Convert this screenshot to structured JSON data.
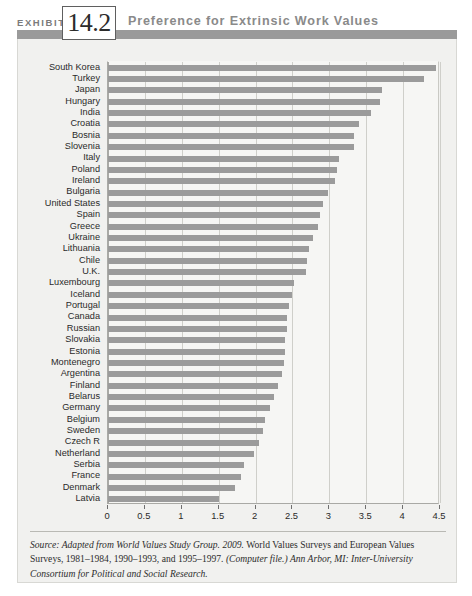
{
  "header": {
    "exhibit_word": "EXHIBIT",
    "exhibit_number": "14.2",
    "title": "Preference for Extrinsic Work Values"
  },
  "colors": {
    "bar": "#9b9b9b",
    "header_bar": "#9a9a9a",
    "panel_bg": "#f1f1ef",
    "plot_bg": "#f6f6f4",
    "gridline": "#cfcfca",
    "axis": "#a9a9a5",
    "title_text": "#8a8a8a"
  },
  "source": {
    "part1_italic": "Source: Adapted from World Values Study Group. 2009.",
    "part2": " World Values Surveys and European Values Surveys, 1981–1984, 1990–1993, and 1995–1997. ",
    "part3_italic": "(Computer file.) Ann Arbor, MI: Inter-University Consortium for Political and Social Research."
  },
  "chart_data": {
    "type": "bar",
    "orientation": "horizontal",
    "title": "Preference for Extrinsic Work Values",
    "xlabel": "",
    "ylabel": "",
    "xlim": [
      0,
      4.5
    ],
    "grid": true,
    "legend": null,
    "xticks": [
      "0",
      "0.5",
      "1",
      "1.5",
      "2",
      "2.5",
      "3",
      "3.5",
      "4",
      "4.5"
    ],
    "xtick_values": [
      0,
      0.5,
      1,
      1.5,
      2,
      2.5,
      3,
      3.5,
      4,
      4.5
    ],
    "categories": [
      "South Korea",
      "Turkey",
      "Japan",
      "Hungary",
      "India",
      "Croatia",
      "Bosnia",
      "Slovenia",
      "Italy",
      "Poland",
      "Ireland",
      "Bulgaria",
      "United States",
      "Spain",
      "Greece",
      "Ukraine",
      "Lithuania",
      "Chile",
      "U.K.",
      "Luxembourg",
      "Iceland",
      "Portugal",
      "Canada",
      "Russian",
      "Slovakia",
      "Estonia",
      "Montenegro",
      "Argentina",
      "Finland",
      "Belarus",
      "Germany",
      "Belgium",
      "Sweden",
      "Czech R",
      "Netherland",
      "Serbia",
      "France",
      "Denmark",
      "Latvia"
    ],
    "values": [
      4.45,
      4.28,
      3.72,
      3.68,
      3.57,
      3.4,
      3.33,
      3.33,
      3.13,
      3.1,
      3.08,
      2.98,
      2.92,
      2.88,
      2.85,
      2.78,
      2.72,
      2.7,
      2.68,
      2.52,
      2.5,
      2.45,
      2.43,
      2.42,
      2.4,
      2.4,
      2.38,
      2.36,
      2.3,
      2.25,
      2.2,
      2.13,
      2.1,
      2.05,
      1.98,
      1.85,
      1.8,
      1.72,
      1.5
    ]
  }
}
